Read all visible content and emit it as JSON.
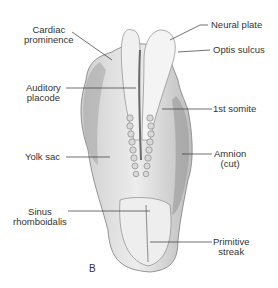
{
  "figure": {
    "panel_letter": "B",
    "colors": {
      "line": "#333333",
      "text": "#333333",
      "tissue_light": "#e6e6e6",
      "tissue_mid": "#b5b5b5",
      "tissue_dark": "#7d7d7d"
    }
  },
  "labels": {
    "cardiac_prominence": [
      "Cardiac",
      "prominence"
    ],
    "auditory_placode": [
      "Auditory",
      "placode"
    ],
    "yolk_sac": "Yolk sac",
    "sinus_rhomboidalis": [
      "Sinus",
      "rhomboidalis"
    ],
    "neural_plate": "Neural plate",
    "optis_sulcus": "Optis sulcus",
    "first_somite": "1st somite",
    "amnion": [
      "Amnion",
      "(cut)"
    ],
    "primitive_streak": [
      "Primitive",
      "streak"
    ]
  }
}
